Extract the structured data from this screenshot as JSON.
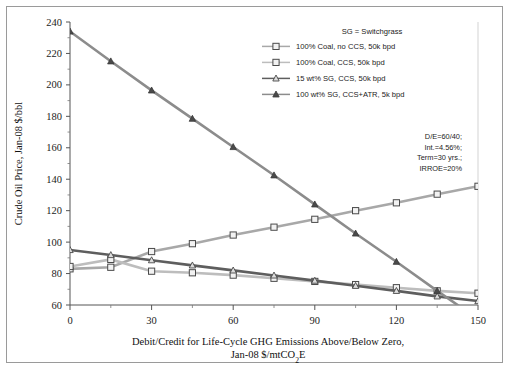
{
  "chart_data": {
    "type": "line",
    "title": "",
    "xlabel": "Debit/Credit for Life-Cycle GHG Emissions Above/Below Zero,",
    "xlabel_line2": "Jan-08 $/mtCO2E",
    "ylabel": "Crude Oil Price, Jan-08 $/bbl",
    "xlim": [
      0,
      150
    ],
    "ylim": [
      60,
      240
    ],
    "xticks": [
      0,
      30,
      60,
      90,
      120,
      150
    ],
    "xticks_minor": [
      15,
      45,
      75,
      105,
      135
    ],
    "yticks": [
      60,
      80,
      100,
      120,
      140,
      160,
      180,
      200,
      220,
      240
    ],
    "grid": false,
    "legend_position": "top-right",
    "x": [
      0,
      15,
      30,
      45,
      60,
      75,
      90,
      105,
      120,
      135,
      150
    ],
    "series": [
      {
        "name": "100% Coal, no CCS, 50k bpd",
        "marker": "open-square",
        "color": "#a8a8a8",
        "values": [
          83,
          84,
          94,
          99,
          104.5,
          109.5,
          114.5,
          120,
          125,
          130.5,
          135.5
        ]
      },
      {
        "name": "100% Coal, CCS, 50k bpd",
        "marker": "open-square",
        "color": "#bdbdbd",
        "values": [
          84.5,
          89,
          81.5,
          80.5,
          79,
          77,
          75,
          73,
          71,
          69,
          67.5
        ]
      },
      {
        "name": "15 wt% SG, CCS, 50k bpd",
        "marker": "open-triangle",
        "color": "#5e5e5e",
        "values": [
          95,
          91.8,
          88.5,
          85.2,
          82,
          78.8,
          75.5,
          72.2,
          69,
          65.5,
          62.5
        ]
      },
      {
        "name": "100 wt% SG, CCS+ATR, 5k bpd",
        "marker": "filled-triangle",
        "color": "#8c8c8c",
        "values": [
          234,
          215,
          196.5,
          178.5,
          160.5,
          142.5,
          124,
          105.5,
          87.5,
          69,
          51
        ]
      }
    ],
    "annotations": {
      "sg_note": "SG = Switchgrass",
      "finance": [
        "D/E=60/40;",
        "Int.=4.56%;",
        "Term=30 yrs.;",
        "IRROE=20%"
      ]
    }
  }
}
